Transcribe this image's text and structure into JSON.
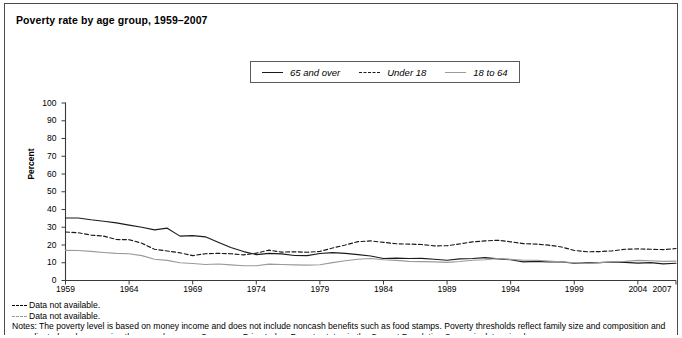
{
  "figure": {
    "title": "Poverty rate by age group, 1959–2007"
  },
  "legend": {
    "position": "top-center",
    "items": [
      {
        "label": "65 and over",
        "style": "solid",
        "color": "#1a1a1a"
      },
      {
        "label": "Under 18",
        "style": "dashed",
        "color": "#1a1a1a"
      },
      {
        "label": "18 to 64",
        "style": "solid",
        "color": "#9a9a9a"
      }
    ]
  },
  "axes": {
    "ylabel": "Percent",
    "yticks": [
      "0",
      "10",
      "20",
      "30",
      "40",
      "50",
      "60",
      "70",
      "80",
      "90",
      "100"
    ],
    "xticks": [
      "1959",
      "1964",
      "1969",
      "1974",
      "1979",
      "1984",
      "1989",
      "1994",
      "1999",
      "2004",
      "2007"
    ]
  },
  "footnotes": [
    {
      "marker": "dash-dark",
      "text": "Data not available."
    },
    {
      "marker": "dash-light",
      "text": "Data not available."
    }
  ],
  "notes": "Notes: The poverty level is based on money income and does not include noncash benefits such as food stamps. Poverty thresholds reflect family size and composition and are adjusted each year using the annual average Consumer Price Index. Poverty status in the Current Population Survey is determined",
  "chart_data": {
    "type": "line",
    "title": "Poverty rate by age group, 1959–2007",
    "xlabel": "",
    "ylabel": "Percent",
    "xlim": [
      1959,
      2007
    ],
    "ylim": [
      0,
      100
    ],
    "grid": false,
    "legend_position": "top-center",
    "x": [
      1959,
      1960,
      1961,
      1962,
      1963,
      1964,
      1965,
      1966,
      1967,
      1968,
      1969,
      1970,
      1971,
      1972,
      1973,
      1974,
      1975,
      1976,
      1977,
      1978,
      1979,
      1980,
      1981,
      1982,
      1983,
      1984,
      1985,
      1986,
      1987,
      1988,
      1989,
      1990,
      1991,
      1992,
      1993,
      1994,
      1995,
      1996,
      1997,
      1998,
      1999,
      2000,
      2001,
      2002,
      2003,
      2004,
      2005,
      2006,
      2007
    ],
    "series": [
      {
        "name": "65 and over",
        "style": "solid",
        "color": "#1a1a1a",
        "values": [
          35.2,
          35.2,
          34.2,
          33.4,
          32.5,
          31.2,
          30.0,
          28.5,
          29.5,
          25.0,
          25.3,
          24.6,
          21.6,
          18.6,
          16.3,
          14.6,
          15.3,
          15.0,
          14.1,
          14.0,
          15.2,
          15.7,
          15.3,
          14.6,
          13.8,
          12.4,
          12.6,
          12.4,
          12.5,
          12.0,
          11.4,
          12.2,
          12.4,
          12.9,
          12.2,
          11.7,
          10.5,
          10.8,
          10.5,
          10.5,
          9.7,
          9.9,
          10.1,
          10.4,
          10.2,
          9.8,
          10.1,
          9.4,
          9.7
        ]
      },
      {
        "name": "Under 18",
        "style": "dashed",
        "color": "#1a1a1a",
        "values": [
          27.3,
          26.9,
          25.6,
          25.0,
          23.1,
          23.0,
          21.0,
          17.6,
          16.6,
          15.6,
          14.0,
          15.1,
          15.3,
          15.1,
          14.4,
          15.4,
          17.1,
          16.0,
          16.2,
          15.9,
          16.4,
          18.3,
          20.0,
          21.9,
          22.3,
          21.5,
          20.7,
          20.5,
          20.3,
          19.5,
          19.6,
          20.6,
          21.8,
          22.3,
          22.7,
          21.8,
          20.8,
          20.5,
          19.9,
          18.9,
          16.9,
          16.2,
          16.3,
          16.7,
          17.6,
          17.8,
          17.6,
          17.4,
          18.0
        ]
      },
      {
        "name": "18 to 64",
        "style": "solid",
        "color": "#9a9a9a",
        "values": [
          17.0,
          16.9,
          16.4,
          15.8,
          15.3,
          15.1,
          14.0,
          12.0,
          11.3,
          10.0,
          9.6,
          9.0,
          9.3,
          8.8,
          8.3,
          8.3,
          9.2,
          9.0,
          8.8,
          8.7,
          8.9,
          10.1,
          11.1,
          12.0,
          12.4,
          11.7,
          11.3,
          10.8,
          10.6,
          10.5,
          10.2,
          10.7,
          11.4,
          11.7,
          12.4,
          11.9,
          11.4,
          11.4,
          10.9,
          10.5,
          10.0,
          9.6,
          10.1,
          10.6,
          10.8,
          11.3,
          11.1,
          10.8,
          10.9
        ]
      }
    ]
  }
}
